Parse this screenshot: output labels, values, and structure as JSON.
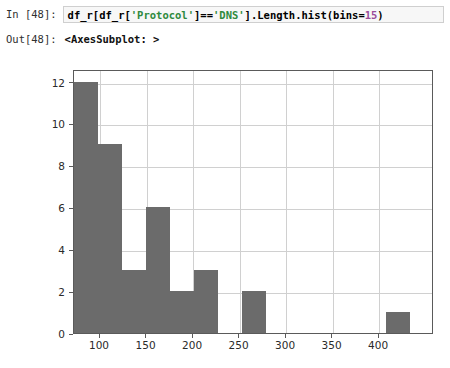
{
  "notebook": {
    "input_prompt": "In [48]:",
    "output_prompt": "Out[48]:",
    "code_parts": {
      "p1": "df_r[df_r[",
      "s1": "'Protocol'",
      "p2": "]==",
      "s2": "'DNS'",
      "p3": "].Length.hist(bins=",
      "n1": "15",
      "p4": ")"
    },
    "code_full": "df_r[df_r['Protocol']=='DNS'].Length.hist(bins=15)",
    "output_text": "<AxesSubplot: >"
  },
  "colors": {
    "bar_fill": "#6b6b6b",
    "grid": "#d0d0d0",
    "spine": "#5a5a5a",
    "cell_bg": "#f7f7f7",
    "cell_border": "#cfcfcf"
  },
  "chart_data": {
    "type": "bar",
    "chart_subtype": "histogram",
    "title": "",
    "xlabel": "",
    "ylabel": "",
    "bins": 15,
    "grid": true,
    "legend": null,
    "xlim": [
      72,
      459
    ],
    "ylim": [
      0,
      12.6
    ],
    "xticks": [
      100,
      150,
      200,
      250,
      300,
      350,
      400
    ],
    "xtick_labels": [
      "100",
      "150",
      "200",
      "250",
      "300",
      "350",
      "400"
    ],
    "yticks": [
      0,
      2,
      4,
      6,
      8,
      10,
      12
    ],
    "ytick_labels": [
      "0",
      "2",
      "4",
      "6",
      "8",
      "10",
      "12"
    ],
    "bin_edges": [
      72,
      97.8,
      123.6,
      149.4,
      175.2,
      201,
      226.8,
      252.6,
      278.4,
      304.2,
      330,
      355.8,
      381.6,
      407.4,
      433.2,
      459
    ],
    "values": [
      12,
      9,
      3,
      6,
      2,
      3,
      0,
      2,
      0,
      0,
      0,
      0,
      0,
      1,
      0
    ],
    "bar_color": "#6b6b6b"
  }
}
